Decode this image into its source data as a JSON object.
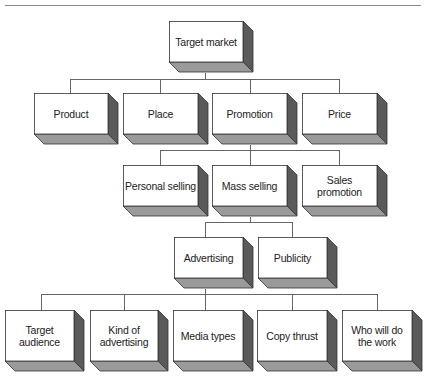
{
  "colors": {
    "face": "#ffffff",
    "side": "#5a5a5a",
    "bottom": "#9a9a9a",
    "stroke": "#333333",
    "line": "#666666"
  },
  "boxes": [
    {
      "id": "target-market",
      "label": "Target market",
      "x": 169,
      "y": 21,
      "w": 74,
      "h": 41
    },
    {
      "id": "product",
      "label": "Product",
      "x": 34,
      "y": 93,
      "w": 74,
      "h": 41
    },
    {
      "id": "place",
      "label": "Place",
      "x": 123,
      "y": 93,
      "w": 75,
      "h": 41
    },
    {
      "id": "promotion",
      "label": "Promotion",
      "x": 212,
      "y": 93,
      "w": 75,
      "h": 41
    },
    {
      "id": "price",
      "label": "Price",
      "x": 302,
      "y": 93,
      "w": 75,
      "h": 41
    },
    {
      "id": "personal-selling",
      "label": "Personal selling",
      "x": 123,
      "y": 165,
      "w": 75,
      "h": 41
    },
    {
      "id": "mass-selling",
      "label": "Mass selling",
      "x": 212,
      "y": 165,
      "w": 75,
      "h": 41
    },
    {
      "id": "sales-promotion",
      "label": "Sales promotion",
      "x": 302,
      "y": 165,
      "w": 75,
      "h": 41
    },
    {
      "id": "advertising",
      "label": "Advertising",
      "x": 174,
      "y": 237,
      "w": 69,
      "h": 41
    },
    {
      "id": "publicity",
      "label": "Publicity",
      "x": 258,
      "y": 237,
      "w": 69,
      "h": 41
    },
    {
      "id": "target-audience",
      "label": "Target audience",
      "x": 5,
      "y": 310,
      "w": 69,
      "h": 51
    },
    {
      "id": "kind-of-advertising",
      "label": "Kind of advertising",
      "x": 90,
      "y": 310,
      "w": 68,
      "h": 51
    },
    {
      "id": "media-types",
      "label": "Media types",
      "x": 173,
      "y": 310,
      "w": 70,
      "h": 51
    },
    {
      "id": "copy-thrust",
      "label": "Copy thrust",
      "x": 257,
      "y": 310,
      "w": 70,
      "h": 51
    },
    {
      "id": "who-will-do-the-work",
      "label": "Who will do the work",
      "x": 342,
      "y": 310,
      "w": 70,
      "h": 51
    }
  ],
  "connectors": [
    {
      "x1": 205,
      "y1": 73,
      "x2": 205,
      "y2": 79
    },
    {
      "x1": 70,
      "y1": 79,
      "x2": 339,
      "y2": 79
    },
    {
      "x1": 70,
      "y1": 79,
      "x2": 70,
      "y2": 93
    },
    {
      "x1": 160,
      "y1": 79,
      "x2": 160,
      "y2": 93
    },
    {
      "x1": 250,
      "y1": 79,
      "x2": 250,
      "y2": 93
    },
    {
      "x1": 339,
      "y1": 79,
      "x2": 339,
      "y2": 93
    },
    {
      "x1": 250,
      "y1": 145,
      "x2": 250,
      "y2": 150
    },
    {
      "x1": 160,
      "y1": 150,
      "x2": 339,
      "y2": 150
    },
    {
      "x1": 160,
      "y1": 150,
      "x2": 160,
      "y2": 165
    },
    {
      "x1": 250,
      "y1": 150,
      "x2": 250,
      "y2": 165
    },
    {
      "x1": 339,
      "y1": 150,
      "x2": 339,
      "y2": 165
    },
    {
      "x1": 250,
      "y1": 217,
      "x2": 250,
      "y2": 222
    },
    {
      "x1": 205,
      "y1": 222,
      "x2": 292,
      "y2": 222
    },
    {
      "x1": 205,
      "y1": 222,
      "x2": 205,
      "y2": 237
    },
    {
      "x1": 292,
      "y1": 222,
      "x2": 292,
      "y2": 237
    },
    {
      "x1": 205,
      "y1": 289,
      "x2": 205,
      "y2": 294
    },
    {
      "x1": 41,
      "y1": 294,
      "x2": 377,
      "y2": 294
    },
    {
      "x1": 41,
      "y1": 294,
      "x2": 41,
      "y2": 310
    },
    {
      "x1": 124,
      "y1": 294,
      "x2": 124,
      "y2": 310
    },
    {
      "x1": 205,
      "y1": 294,
      "x2": 205,
      "y2": 310
    },
    {
      "x1": 292,
      "y1": 294,
      "x2": 292,
      "y2": 310
    },
    {
      "x1": 377,
      "y1": 294,
      "x2": 377,
      "y2": 310
    }
  ]
}
